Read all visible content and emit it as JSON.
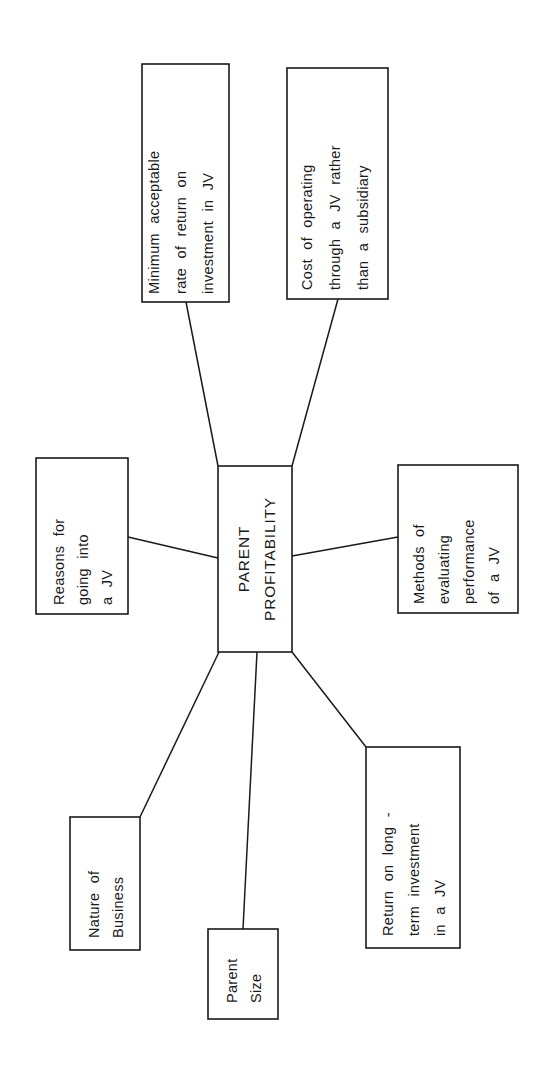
{
  "diagram": {
    "center": {
      "lines": [
        "PARENT",
        "PROFITABILITY"
      ]
    },
    "nodes": [
      {
        "id": "minimum-return",
        "lines": [
          "Minimum   acceptable",
          "rate  of  return  on",
          "investment  in  JV"
        ]
      },
      {
        "id": "cost-of-operating",
        "lines": [
          "Cost  of  operating",
          "through  a  JV  rather",
          "than  a  subsidiary"
        ]
      },
      {
        "id": "reasons",
        "lines": [
          "Reasons  for",
          "going  into",
          "a  JV"
        ]
      },
      {
        "id": "methods",
        "lines": [
          "Methods  of",
          "evaluating",
          "performance",
          "of  a  JV"
        ]
      },
      {
        "id": "nature",
        "lines": [
          "Nature  of",
          "Business"
        ]
      },
      {
        "id": "parent-size",
        "lines": [
          "Parent",
          "Size"
        ]
      },
      {
        "id": "return-long-term",
        "lines": [
          "Return  on  long -",
          "term  investment",
          "in  a  JV"
        ]
      }
    ],
    "colors": {
      "ink": "#1a1a1a",
      "background": "#ffffff"
    }
  }
}
